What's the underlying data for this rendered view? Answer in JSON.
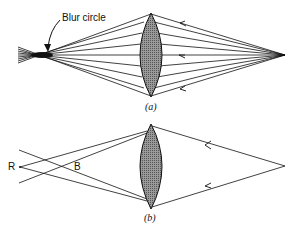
{
  "figure_a": {
    "annotation": "Blur circle",
    "caption": "(a)"
  },
  "figure_b": {
    "point_red": "R",
    "point_blue": "B",
    "caption": "(b)"
  },
  "colors": {
    "line": "#111111",
    "lens_fill": "#8a8a8a"
  }
}
